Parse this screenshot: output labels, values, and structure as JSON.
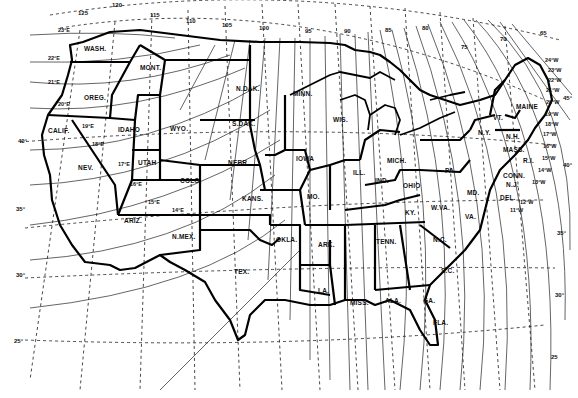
{
  "map": {
    "subject": "Isogonic chart of the United States (magnetic declination)",
    "longitude_labels": [
      "125",
      "120",
      "115",
      "110",
      "105",
      "100",
      "95",
      "90",
      "85",
      "80",
      "75",
      "70",
      "65"
    ],
    "latitude_labels": [
      "45°",
      "40°",
      "35°",
      "30°",
      "25°"
    ],
    "latitude_labels_right": [
      "45°",
      "40°",
      "35°",
      "30°",
      "25"
    ],
    "isogonic_labels_west_coast": [
      "23°E",
      "22°E",
      "21°E",
      "20°E",
      "19°E",
      "18°E",
      "17°E",
      "16°E",
      "15°E",
      "14°E"
    ],
    "isogonic_labels_east_coast": [
      "24°W",
      "23°W",
      "22°W",
      "21°W",
      "20°W",
      "19°W",
      "18°W",
      "17°W",
      "16°W",
      "15°W",
      "14°W",
      "13°W",
      "12°W",
      "11°W"
    ],
    "states": {
      "wash": "WASH.",
      "oreg": "OREG.",
      "calif": "CALIF.",
      "nev": "NEV.",
      "idaho": "IDAHO",
      "mont": "MONT.",
      "wyo": "WYO.",
      "utah": "UTAH",
      "ariz": "ARIZ.",
      "colo": "COLO.",
      "nmex": "N.MEX.",
      "ndak": "N.DAK.",
      "sdak": "S.DAK.",
      "nebr": "NEBR.",
      "kans": "KANS.",
      "okla": "OKLA.",
      "tex": "TEX.",
      "minn": "MINN.",
      "iowa": "IOWA",
      "mo": "MO.",
      "ark": "ARK.",
      "la": "LA.",
      "wis": "WIS.",
      "ill": "ILL.",
      "mich": "MICH.",
      "ind": "IND.",
      "ohio": "OHIO",
      "ky": "KY.",
      "tenn": "TENN.",
      "miss": "MISS.",
      "ala": "ALA.",
      "ga": "GA.",
      "fla": "FLA.",
      "sc": "S.C.",
      "nc": "N.C.",
      "va": "VA.",
      "wva": "W.VA.",
      "pa": "PA.",
      "ny": "N.Y.",
      "vt": "VT.",
      "nh": "N.H.",
      "maine": "MAINE",
      "mass": "MASS.",
      "conn": "CONN.",
      "ri": "R.I.",
      "nj": "N.J.",
      "del": "DEL.",
      "md": "MD."
    },
    "colors": {
      "ink": "#111111",
      "paper": "#ffffff"
    }
  }
}
